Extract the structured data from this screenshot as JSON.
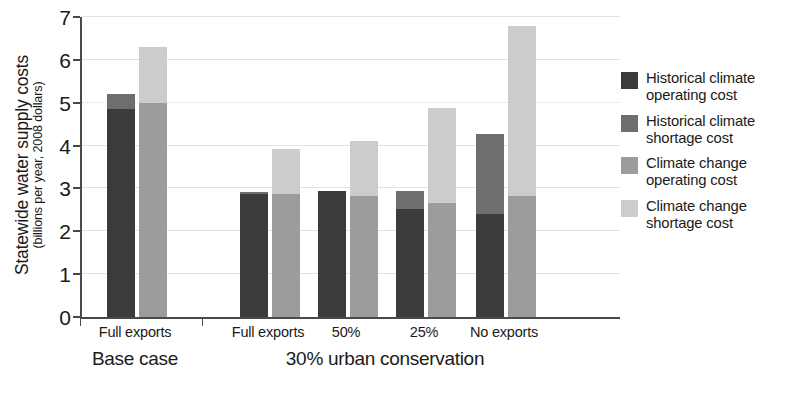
{
  "chart_data": {
    "type": "bar",
    "subtype": "grouped-stacked",
    "title": "",
    "xlabel": "",
    "ylabel": "Statewide water supply costs",
    "ylabel_sub": "(billions per year, 2008 dollars)",
    "ylim": [
      0,
      7
    ],
    "yticks": [
      0,
      1,
      2,
      3,
      4,
      5,
      6,
      7
    ],
    "ytick_labels": [
      "0",
      "1",
      "2",
      "3",
      "4",
      "5",
      "6",
      "7"
    ],
    "grid": true,
    "grid_axis": "y",
    "legend_position": "right",
    "categories": [
      "Full exports",
      "Full exports",
      "50%",
      "25%",
      "No exports"
    ],
    "group_labels": [
      {
        "label": "Base case",
        "categories": [
          "Full exports"
        ]
      },
      {
        "label": "30% urban conservation",
        "categories": [
          "Full exports",
          "50%",
          "25%",
          "No exports"
        ]
      }
    ],
    "series": [
      {
        "name": "Historical climate operating cost",
        "color": "#3b3b3b",
        "stack": "historical",
        "values": [
          4.85,
          2.88,
          2.93,
          2.52,
          2.4
        ]
      },
      {
        "name": "Historical climate shortage cost",
        "color": "#6e6e6e",
        "stack": "historical",
        "values": [
          0.35,
          0.04,
          0.0,
          0.43,
          1.88
        ]
      },
      {
        "name": "Climate change operating cost",
        "color": "#9c9c9c",
        "stack": "climate_change",
        "values": [
          5.0,
          2.88,
          2.82,
          2.65,
          2.82
        ]
      },
      {
        "name": "Climate change shortage cost",
        "color": "#cccccc",
        "stack": "climate_change",
        "values": [
          1.3,
          1.05,
          1.28,
          2.22,
          3.96
        ]
      }
    ],
    "stack_totals": {
      "historical": [
        5.2,
        2.92,
        2.93,
        2.95,
        4.28
      ],
      "climate_change": [
        6.3,
        3.93,
        4.1,
        4.87,
        6.78
      ]
    },
    "annotations": []
  },
  "legend": {
    "items": [
      {
        "label_line1": "Historical climate",
        "label_line2": "operating cost",
        "color": "#3b3b3b",
        "icon": "legend-swatch-icon"
      },
      {
        "label_line1": "Historical climate",
        "label_line2": "shortage cost",
        "color": "#6e6e6e",
        "icon": "legend-swatch-icon"
      },
      {
        "label_line1": "Climate change",
        "label_line2": "operating cost",
        "color": "#9c9c9c",
        "icon": "legend-swatch-icon"
      },
      {
        "label_line1": "Climate change",
        "label_line2": "shortage cost",
        "color": "#cccccc",
        "icon": "legend-swatch-icon"
      }
    ]
  },
  "axis": {
    "y_title_main": "Statewide water supply costs",
    "y_title_sub": "(billions per year, 2008 dollars)"
  },
  "colors": {
    "axis_line": "#4a4a4a",
    "gridline": "#e2e2e2",
    "background": "#ffffff",
    "text": "#1a1a1a"
  }
}
